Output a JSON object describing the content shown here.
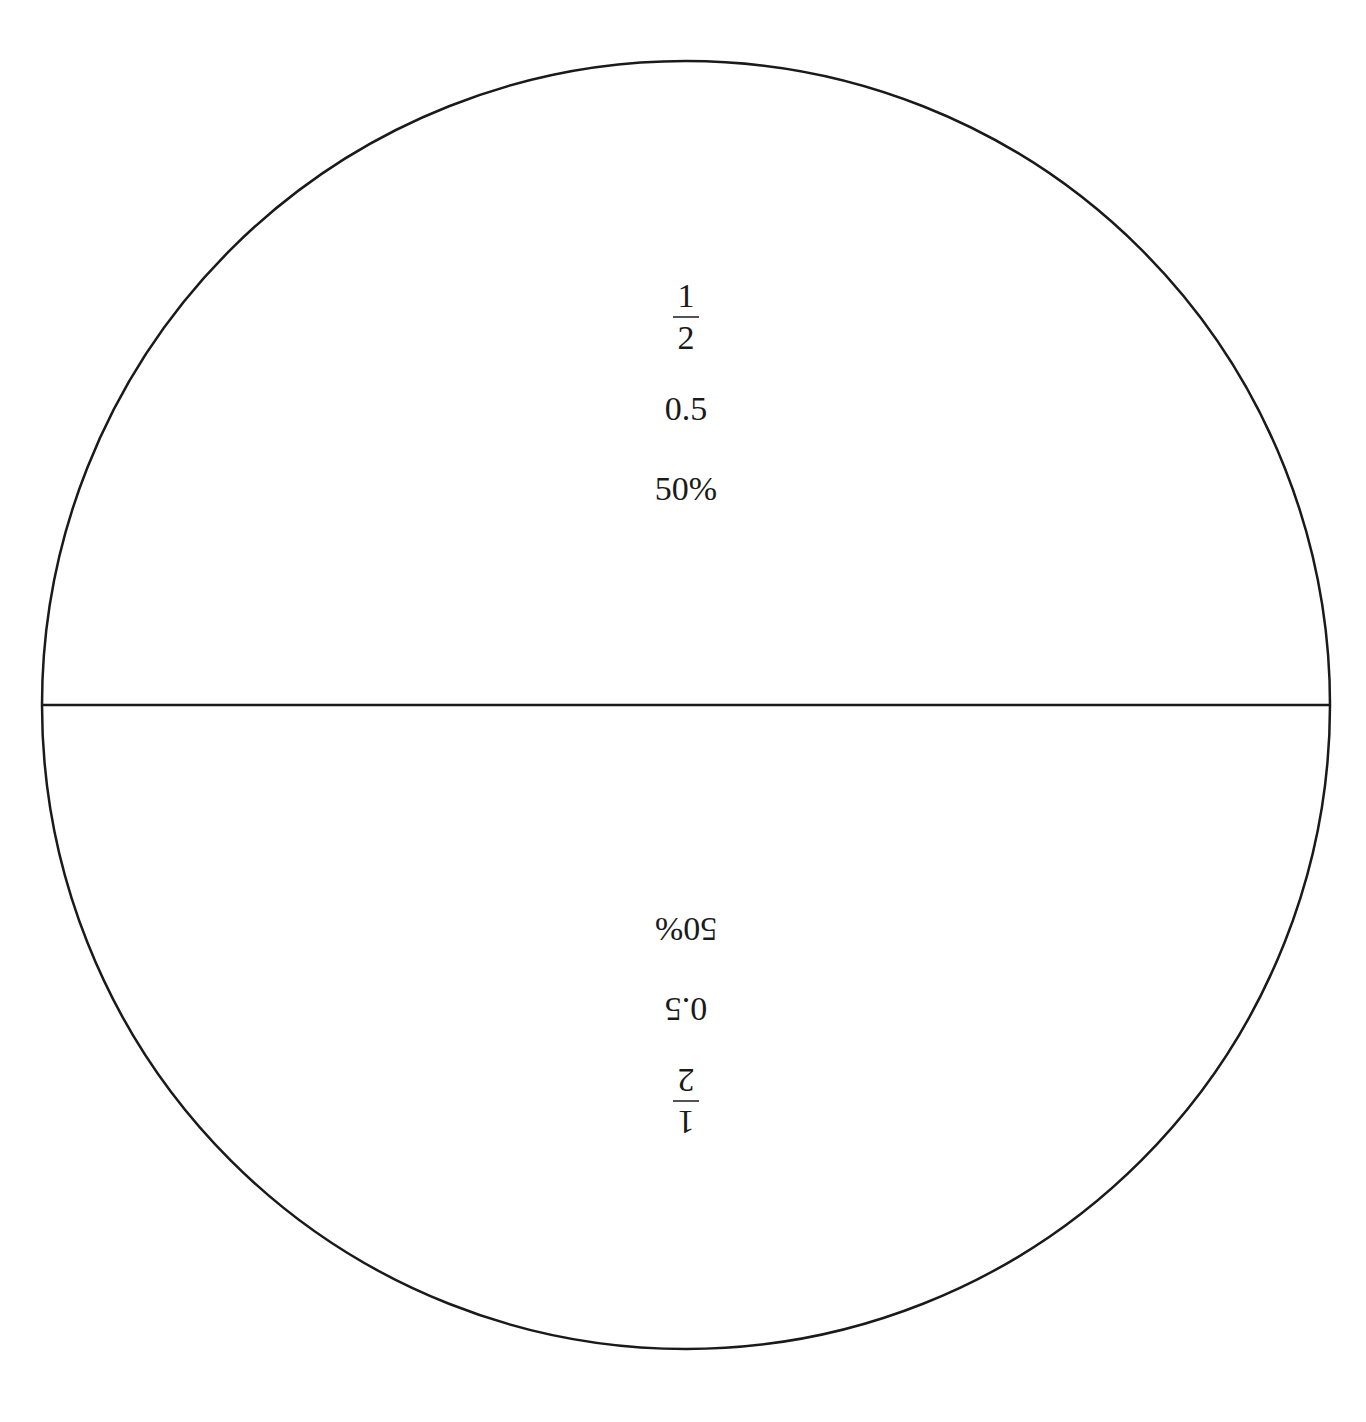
{
  "diagram": {
    "type": "fraction-circle",
    "circle": {
      "cx": 686,
      "cy": 705,
      "r": 644,
      "stroke": "#1a1a1a"
    },
    "divider": "horizontal",
    "halves": [
      {
        "position": "top",
        "orientation": "upright",
        "fraction": {
          "numerator": "1",
          "denominator": "2"
        },
        "decimal": "0.5",
        "percent": "50%"
      },
      {
        "position": "bottom",
        "orientation": "upside-down",
        "fraction": {
          "numerator": "1",
          "denominator": "2"
        },
        "decimal": "0.5",
        "percent": "50%"
      }
    ]
  }
}
